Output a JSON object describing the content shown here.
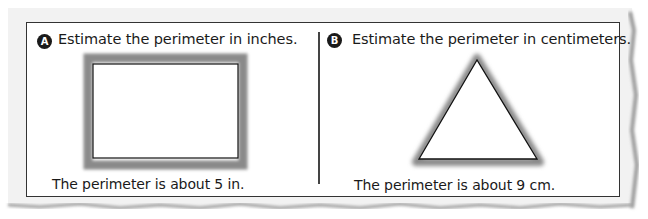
{
  "problems": [
    {
      "label": "A",
      "prompt": "Estimate the perimeter in inches.",
      "shape": "rectangle",
      "answer": "The perimeter is about 5 in."
    },
    {
      "label": "B",
      "prompt": "Estimate the perimeter in centimeters.",
      "shape": "triangle",
      "answer": "The perimeter is about 9 cm."
    }
  ],
  "colors": {
    "paper_shadow": "#bdbdbd",
    "shape_highlight": "#8a8a8a",
    "outline": "#111111",
    "label_circle": "#1a1a1a"
  }
}
